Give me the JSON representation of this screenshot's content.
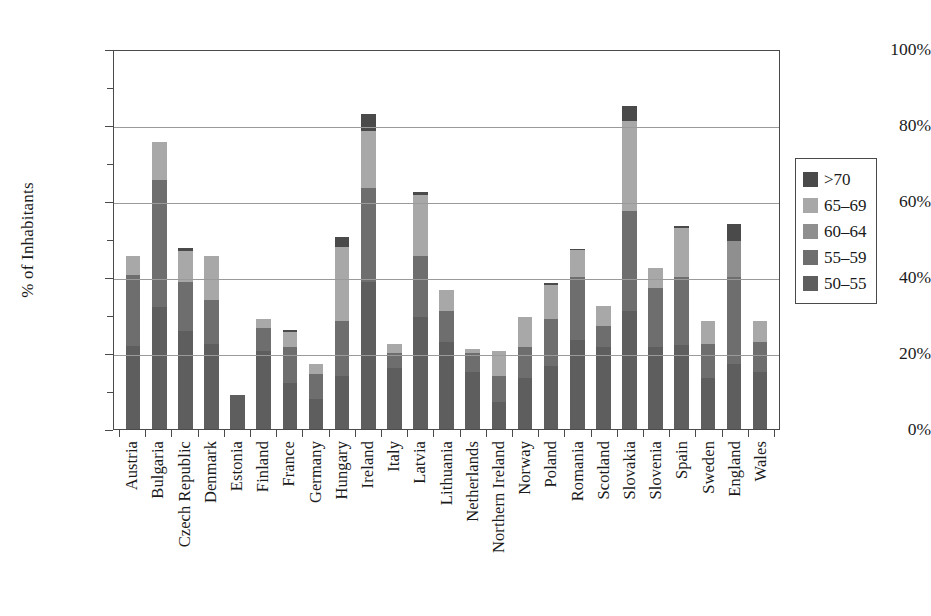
{
  "chart_data": {
    "type": "bar",
    "subtype": "stacked-vertical",
    "title": "",
    "xlabel": "",
    "ylabel": "% of Inhabitants",
    "ylim": [
      0,
      100
    ],
    "yticks": [
      0,
      20,
      40,
      60,
      80,
      100
    ],
    "ytick_labels": [
      "0%",
      "20%",
      "40%",
      "60%",
      "80%",
      "100%"
    ],
    "yminor_ticks": [
      10,
      30,
      50,
      70,
      90
    ],
    "grid": "horizontal",
    "legend_position": "right",
    "stack_order_bottom_to_top": [
      "50-55",
      "55-59",
      "60-64",
      "65-69",
      ">70"
    ],
    "categories": [
      "Austria",
      "Bulgaria",
      "Czech Republic",
      "Denmark",
      "Estonia",
      "Finland",
      "France",
      "Germany",
      "Hungary",
      "Ireland",
      "Italy",
      "Latvia",
      "Lithuania",
      "Netherlands",
      "Northern Ireland",
      "Norway",
      "Poland",
      "Romania",
      "Scotland",
      "Slovakia",
      "Slovenia",
      "Spain",
      "Sweden",
      "England",
      "Wales"
    ],
    "series": [
      {
        "name": "50-55",
        "color": "#5e5e5e",
        "values": [
          21.8,
          32.0,
          25.8,
          22.5,
          9.0,
          20.5,
          12.0,
          8.0,
          14.0,
          38.8,
          16.0,
          29.5,
          23.0,
          15.0,
          7.0,
          13.5,
          16.5,
          23.5,
          21.5,
          31.0,
          21.5,
          22.0,
          13.5,
          17.0,
          15.0
        ]
      },
      {
        "name": "55-59",
        "color": "#6e6e6e",
        "values": [
          18.8,
          33.5,
          12.8,
          11.5,
          0.0,
          6.0,
          9.5,
          6.5,
          14.5,
          24.7,
          4.0,
          16.0,
          8.0,
          5.0,
          7.0,
          8.0,
          12.5,
          16.5,
          5.5,
          26.5,
          15.5,
          18.0,
          9.0,
          23.0,
          8.0
        ]
      },
      {
        "name": "60-64",
        "color": "#8f8f8f",
        "values": [
          0.0,
          0.0,
          0.0,
          0.0,
          0.0,
          0.0,
          0.0,
          0.0,
          0.0,
          0.0,
          0.0,
          0.0,
          0.0,
          0.0,
          0.0,
          0.0,
          0.0,
          0.0,
          0.0,
          0.0,
          0.0,
          0.0,
          0.0,
          9.5,
          0.0
        ]
      },
      {
        "name": "65-69",
        "color": "#a8a8a8",
        "values": [
          4.9,
          10.0,
          8.3,
          11.5,
          0.0,
          2.5,
          4.0,
          2.5,
          19.5,
          15.0,
          2.5,
          16.0,
          5.5,
          1.0,
          6.5,
          8.0,
          9.0,
          7.0,
          5.5,
          23.5,
          5.5,
          13.0,
          6.0,
          0.0,
          5.5
        ]
      },
      {
        "name": ">70",
        "color": "#4a4a4a",
        "values": [
          0.0,
          0.0,
          0.8,
          0.0,
          0.0,
          0.0,
          0.5,
          0.0,
          2.5,
          4.5,
          0.0,
          1.0,
          0.0,
          0.0,
          0.0,
          0.0,
          0.5,
          0.5,
          0.0,
          4.0,
          0.0,
          0.5,
          0.0,
          4.5,
          0.0
        ]
      }
    ]
  },
  "legend": {
    "items": [
      {
        "label": ">70",
        "color": "#4a4a4a"
      },
      {
        "label": "65–69",
        "color": "#a8a8a8"
      },
      {
        "label": "60–64",
        "color": "#8f8f8f"
      },
      {
        "label": "55–59",
        "color": "#6e6e6e"
      },
      {
        "label": "50–55",
        "color": "#5e5e5e"
      }
    ]
  },
  "axes": {
    "y_title": "% of Inhabitants"
  }
}
